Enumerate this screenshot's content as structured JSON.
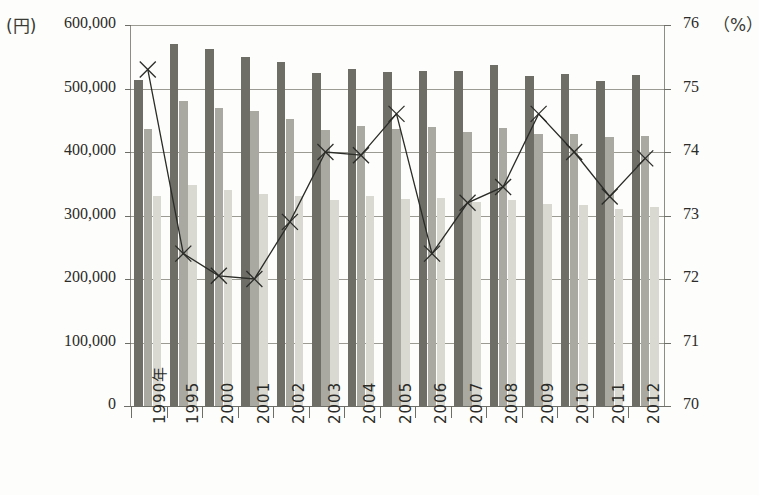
{
  "axes": {
    "left_unit": "(円)",
    "right_unit": "（%）",
    "left_ticks": [
      "600,000",
      "500,000",
      "400,000",
      "300,000",
      "200,000",
      "100,000",
      "0"
    ],
    "right_ticks": [
      "76",
      "75",
      "74",
      "73",
      "72",
      "71",
      "70"
    ]
  },
  "chart_data": {
    "type": "bar",
    "title": "",
    "xlabel": "",
    "ylabel": "(円)",
    "y2label": "（%）",
    "ylim": [
      0,
      600000
    ],
    "y2lim": [
      70,
      76
    ],
    "grid": true,
    "legend_position": "none",
    "categories": [
      "1990年",
      "1995",
      "2000",
      "2001",
      "2002",
      "2003",
      "2004",
      "2005",
      "2006",
      "2007",
      "2008",
      "2009",
      "2010",
      "2011",
      "2012"
    ],
    "series": [
      {
        "name": "bar-series-1",
        "type": "bar",
        "axis": "left",
        "color": "#6e6e67",
        "values": [
          513000,
          570000,
          563000,
          550000,
          541000,
          525000,
          531000,
          526000,
          527000,
          527000,
          537000,
          519000,
          523000,
          512000,
          521000
        ]
      },
      {
        "name": "bar-series-2",
        "type": "bar",
        "axis": "left",
        "color": "#a9a9a2",
        "values": [
          437000,
          481000,
          470000,
          464000,
          452000,
          435000,
          441000,
          436000,
          439000,
          432000,
          438000,
          429000,
          428000,
          424000,
          426000
        ]
      },
      {
        "name": "bar-series-3",
        "type": "bar",
        "axis": "left",
        "color": "#d9d9d2",
        "values": [
          330000,
          348000,
          340000,
          334000,
          330000,
          325000,
          331000,
          326000,
          328000,
          322000,
          324000,
          318000,
          317000,
          311000,
          314000
        ]
      },
      {
        "name": "line-series",
        "type": "line",
        "axis": "right",
        "marker": "x",
        "color": "#2b2b28",
        "values": [
          75.3,
          72.4,
          72.05,
          72.0,
          72.9,
          74.0,
          73.95,
          74.6,
          72.4,
          73.2,
          73.45,
          74.6,
          74.0,
          73.3,
          73.9
        ]
      }
    ]
  }
}
